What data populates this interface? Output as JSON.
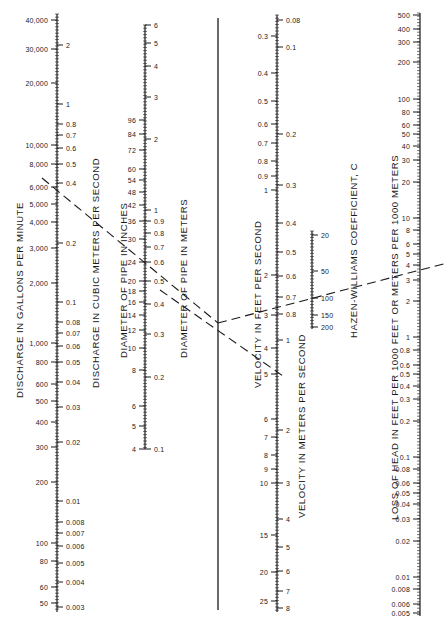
{
  "scales": [
    {
      "id": "discharge-gpm",
      "title": "DISCHARGE IN GALLONS PER MINUTE",
      "axis_x": 57,
      "side": "left",
      "ticks": [
        {
          "v": "40,000",
          "y": 20
        },
        {
          "v": "30,000",
          "y": 49
        },
        {
          "v": "20,000",
          "y": 83
        },
        {
          "v": "10,000",
          "y": 145
        },
        {
          "v": "8,000",
          "y": 164
        },
        {
          "v": "6,000",
          "y": 187
        },
        {
          "v": "5,000",
          "y": 204
        },
        {
          "v": "4,000",
          "y": 222
        },
        {
          "v": "3,000",
          "y": 248
        },
        {
          "v": "2,000",
          "y": 283
        },
        {
          "v": "1,000",
          "y": 343
        },
        {
          "v": "800",
          "y": 362
        },
        {
          "v": "600",
          "y": 384
        },
        {
          "v": "500",
          "y": 401
        },
        {
          "v": "400",
          "y": 422
        },
        {
          "v": "300",
          "y": 447
        },
        {
          "v": "200",
          "y": 482
        },
        {
          "v": "100",
          "y": 543
        },
        {
          "v": "80",
          "y": 561
        },
        {
          "v": "60",
          "y": 587
        },
        {
          "v": "50",
          "y": 603
        }
      ],
      "y_top": 14,
      "y_bottom": 612
    },
    {
      "id": "discharge-cms",
      "title": "DISCHARGE IN CUBIC METERS PER SECOND",
      "axis_x": 57,
      "side": "right",
      "ticks": [
        {
          "v": "2",
          "y": 45
        },
        {
          "v": "1",
          "y": 104
        },
        {
          "v": "0.8",
          "y": 124
        },
        {
          "v": "0.7",
          "y": 135
        },
        {
          "v": "0.6",
          "y": 148
        },
        {
          "v": "0.5",
          "y": 164
        },
        {
          "v": "0.4",
          "y": 183
        },
        {
          "v": "0.2",
          "y": 243
        },
        {
          "v": "0.1",
          "y": 302
        },
        {
          "v": "0.08",
          "y": 322
        },
        {
          "v": "0.07",
          "y": 333
        },
        {
          "v": "0.06",
          "y": 346
        },
        {
          "v": "0.05",
          "y": 362
        },
        {
          "v": "0.04",
          "y": 382
        },
        {
          "v": "0.03",
          "y": 407
        },
        {
          "v": "0.02",
          "y": 442
        },
        {
          "v": "0.01",
          "y": 501
        },
        {
          "v": "0.008",
          "y": 522
        },
        {
          "v": "0.007",
          "y": 533
        },
        {
          "v": "0.006",
          "y": 546
        },
        {
          "v": "0.005",
          "y": 563
        },
        {
          "v": "0.004",
          "y": 582
        },
        {
          "v": "0.003",
          "y": 607
        }
      ]
    },
    {
      "id": "diameter-in",
      "title": "DIAMETER OF PIPE IN INCHES",
      "axis_x": 145,
      "side": "left",
      "ticks": [
        {
          "v": "96",
          "y": 120
        },
        {
          "v": "84",
          "y": 134
        },
        {
          "v": "72",
          "y": 150
        },
        {
          "v": "60",
          "y": 169
        },
        {
          "v": "54",
          "y": 180
        },
        {
          "v": "48",
          "y": 192
        },
        {
          "v": "42",
          "y": 205
        },
        {
          "v": "36",
          "y": 221
        },
        {
          "v": "30",
          "y": 239
        },
        {
          "v": "24",
          "y": 262
        },
        {
          "v": "20",
          "y": 281
        },
        {
          "v": "18",
          "y": 291
        },
        {
          "v": "16",
          "y": 302
        },
        {
          "v": "14",
          "y": 315
        },
        {
          "v": "12",
          "y": 330
        },
        {
          "v": "10",
          "y": 348
        },
        {
          "v": "8",
          "y": 370
        },
        {
          "v": "6",
          "y": 406
        },
        {
          "v": "5",
          "y": 426
        },
        {
          "v": "4",
          "y": 449
        }
      ],
      "y_top": 25,
      "y_bottom": 449
    },
    {
      "id": "diameter-m",
      "title": "DIAMETER OF PIPE IN METERS",
      "axis_x": 145,
      "side": "right",
      "ticks": [
        {
          "v": "6",
          "y": 25
        },
        {
          "v": "5",
          "y": 43
        },
        {
          "v": "4",
          "y": 66
        },
        {
          "v": "3",
          "y": 97
        },
        {
          "v": "2",
          "y": 139
        },
        {
          "v": "1",
          "y": 210
        },
        {
          "v": "0.9",
          "y": 221
        },
        {
          "v": "0.8",
          "y": 233
        },
        {
          "v": "0.7",
          "y": 247
        },
        {
          "v": "0.6",
          "y": 262
        },
        {
          "v": "0.5",
          "y": 281
        },
        {
          "v": "0.4",
          "y": 304
        },
        {
          "v": "0.3",
          "y": 334
        },
        {
          "v": "0.2",
          "y": 377
        },
        {
          "v": "0.1",
          "y": 449
        }
      ]
    },
    {
      "id": "velocity-fps",
      "title": "VELOCITY IN FEET PER SECOND",
      "axis_x": 277,
      "side": "left",
      "ticks": [
        {
          "v": "0.3",
          "y": 36
        },
        {
          "v": "0.4",
          "y": 73
        },
        {
          "v": "0.5",
          "y": 101
        },
        {
          "v": "0.6",
          "y": 124
        },
        {
          "v": "0.7",
          "y": 143
        },
        {
          "v": "0.8",
          "y": 161
        },
        {
          "v": "0.9",
          "y": 176
        },
        {
          "v": "1",
          "y": 190
        },
        {
          "v": "2",
          "y": 275
        },
        {
          "v": "3",
          "y": 315
        },
        {
          "v": "4",
          "y": 348
        },
        {
          "v": "5",
          "y": 374
        },
        {
          "v": "6",
          "y": 419
        },
        {
          "v": "7",
          "y": 437
        },
        {
          "v": "8",
          "y": 455
        },
        {
          "v": "9",
          "y": 469
        },
        {
          "v": "10",
          "y": 483
        },
        {
          "v": "15",
          "y": 535
        },
        {
          "v": "20",
          "y": 572
        },
        {
          "v": "25",
          "y": 601
        }
      ],
      "y_top": 15,
      "y_bottom": 612
    },
    {
      "id": "velocity-mps",
      "title": "VELOCITY IN METERS PER SECOND",
      "axis_x": 277,
      "side": "right",
      "ticks": [
        {
          "v": "0.08",
          "y": 20
        },
        {
          "v": "0.1",
          "y": 47
        },
        {
          "v": "0.2",
          "y": 134
        },
        {
          "v": "0.3",
          "y": 185
        },
        {
          "v": "0.4",
          "y": 223
        },
        {
          "v": "0.5",
          "y": 252
        },
        {
          "v": "0.6",
          "y": 276
        },
        {
          "v": "0.7",
          "y": 297
        },
        {
          "v": "0.8",
          "y": 314
        },
        {
          "v": "1",
          "y": 340
        },
        {
          "v": "2",
          "y": 430
        },
        {
          "v": "3",
          "y": 483
        },
        {
          "v": "4",
          "y": 519
        },
        {
          "v": "5",
          "y": 547
        },
        {
          "v": "6",
          "y": 571
        },
        {
          "v": "7",
          "y": 591
        },
        {
          "v": "8",
          "y": 608
        }
      ]
    },
    {
      "id": "hazen-williams",
      "title": "HAZEN-WILLIAMS COEFFICIENT, C",
      "axis_x": 312,
      "side": "right",
      "ticks": [
        {
          "v": "20",
          "y": 235
        },
        {
          "v": "50",
          "y": 271
        },
        {
          "v": "100",
          "y": 298
        },
        {
          "v": "150",
          "y": 315
        },
        {
          "v": "200",
          "y": 327
        }
      ],
      "y_top": 231,
      "y_bottom": 329
    },
    {
      "id": "head-loss",
      "title": "LOSS OF HEAD IN FEET PER 1000 FEET OR METERS PER 1000 METERS",
      "axis_x": 420,
      "side": "left",
      "ticks": [
        {
          "v": "500",
          "y": 15
        },
        {
          "v": "400",
          "y": 29
        },
        {
          "v": "300",
          "y": 42
        },
        {
          "v": "200",
          "y": 62
        },
        {
          "v": "100",
          "y": 99
        },
        {
          "v": "80",
          "y": 112
        },
        {
          "v": "60",
          "y": 125
        },
        {
          "v": "50",
          "y": 134
        },
        {
          "v": "40",
          "y": 146
        },
        {
          "v": "30",
          "y": 160
        },
        {
          "v": "20",
          "y": 182
        },
        {
          "v": "10",
          "y": 218
        },
        {
          "v": "8",
          "y": 230
        },
        {
          "v": "6",
          "y": 244
        },
        {
          "v": "5",
          "y": 254
        },
        {
          "v": "4",
          "y": 265
        },
        {
          "v": "3",
          "y": 280
        },
        {
          "v": "2",
          "y": 301
        },
        {
          "v": "1",
          "y": 337
        },
        {
          "v": "0.8",
          "y": 350
        },
        {
          "v": "0.6",
          "y": 365
        },
        {
          "v": "0.5",
          "y": 374
        },
        {
          "v": "0.4",
          "y": 386
        },
        {
          "v": "0.3",
          "y": 399
        },
        {
          "v": "0.2",
          "y": 421
        },
        {
          "v": "0.1",
          "y": 457
        },
        {
          "v": "0.08",
          "y": 469
        },
        {
          "v": "0.06",
          "y": 483
        },
        {
          "v": "0.05",
          "y": 493
        },
        {
          "v": "0.04",
          "y": 504
        },
        {
          "v": "0.03",
          "y": 519
        },
        {
          "v": "0.02",
          "y": 541
        },
        {
          "v": "0.01",
          "y": 577
        },
        {
          "v": "0.008",
          "y": 589
        },
        {
          "v": "0.006",
          "y": 604
        },
        {
          "v": "0.005",
          "y": 613
        }
      ],
      "y_top": 13,
      "y_bottom": 616
    }
  ],
  "turning_line": {
    "x": 218,
    "y_top": 18,
    "y_bottom": 610
  },
  "example_lines": [
    {
      "from": [
        42,
        178
      ],
      "to": [
        218,
        323
      ],
      "style": "dashed"
    },
    {
      "from": [
        160,
        290
      ],
      "to": [
        283,
        376
      ],
      "style": "dashed"
    },
    {
      "from": [
        218,
        323
      ],
      "to": [
        447,
        263
      ],
      "style": "dashed"
    }
  ],
  "colors": {
    "ink": "#1a1a1a",
    "background": "#ffffff"
  }
}
